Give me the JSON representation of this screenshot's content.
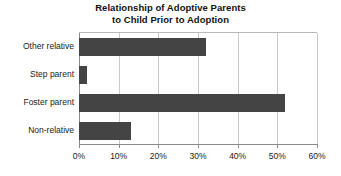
{
  "chart_data": {
    "type": "bar",
    "orientation": "horizontal",
    "title": "Relationship of Adoptive Parents to Child Prior to Adoption",
    "title_lines": [
      "Relationship of Adoptive Parents",
      "to Child Prior to Adoption"
    ],
    "categories": [
      "Other relative",
      "Step parent",
      "Foster parent",
      "Non-relative"
    ],
    "values": [
      32,
      2,
      52,
      13
    ],
    "value_unit": "%",
    "xlabel": "",
    "ylabel": "",
    "xlim": [
      0,
      60
    ],
    "xticks": [
      0,
      10,
      20,
      30,
      40,
      50,
      60
    ],
    "xtick_labels": [
      "0%",
      "10%",
      "20%",
      "30%",
      "40%",
      "50%",
      "60%"
    ],
    "grid": true,
    "grid_axis": "x",
    "legend": false,
    "bar_color": "#444444",
    "grid_color": "#c9c9c9",
    "axis_color": "#8a8a8a",
    "background_color": "#ffffff"
  }
}
